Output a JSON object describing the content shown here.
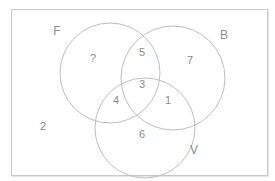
{
  "diagram": {
    "type": "venn",
    "sets": [
      {
        "id": "F",
        "label": "F",
        "cx": 110,
        "cy": 73,
        "r": 50,
        "label_x": 57,
        "label_y": 31
      },
      {
        "id": "B",
        "label": "B",
        "cx": 173,
        "cy": 78,
        "r": 52,
        "label_x": 224,
        "label_y": 35
      },
      {
        "id": "V",
        "label": "V",
        "cx": 145,
        "cy": 128,
        "r": 50,
        "label_x": 194,
        "label_y": 150
      }
    ],
    "regions": [
      {
        "name": "F-only",
        "value": "?",
        "x": 93,
        "y": 58
      },
      {
        "name": "F-and-B-only",
        "value": "5",
        "x": 142,
        "y": 52
      },
      {
        "name": "B-only",
        "value": "7",
        "x": 190,
        "y": 60
      },
      {
        "name": "F-and-B-and-V",
        "value": "3",
        "x": 142,
        "y": 84
      },
      {
        "name": "F-and-V-only",
        "value": "4",
        "x": 116,
        "y": 100
      },
      {
        "name": "B-and-V-only",
        "value": "1",
        "x": 168,
        "y": 100
      },
      {
        "name": "V-only",
        "value": "6",
        "x": 142,
        "y": 134
      },
      {
        "name": "outside-all",
        "value": "2",
        "x": 43,
        "y": 126
      }
    ],
    "colors": {
      "stroke": "#bdbdbd",
      "text": "#8a8a8a",
      "frame": "#c8c8c8"
    }
  }
}
